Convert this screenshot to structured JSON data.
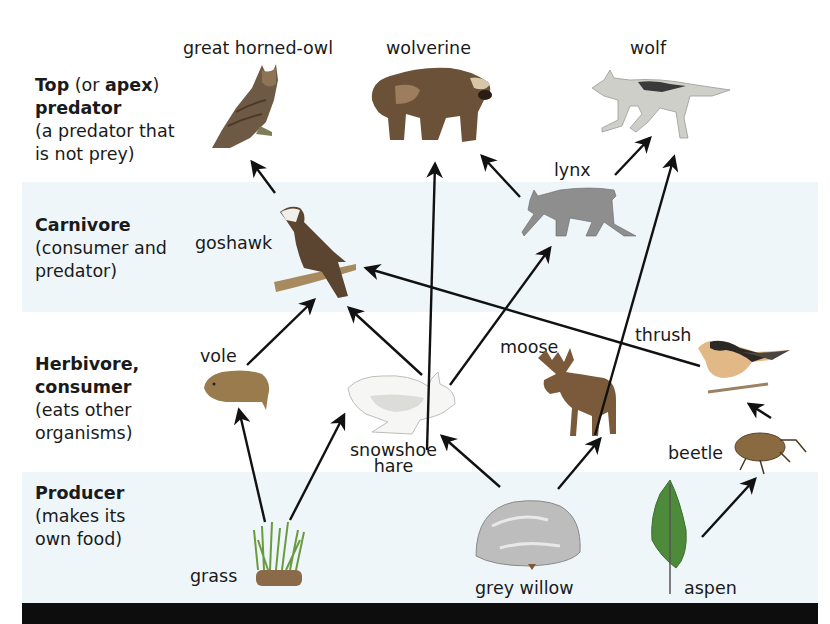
{
  "levels": [
    {
      "id": "top",
      "bold1": "Top",
      "normal1": " (or ",
      "bold2": "apex",
      "normal2": ")",
      "bold3": "predator",
      "desc1": "(a predator that",
      "desc2": "is not prey)"
    },
    {
      "id": "carnivore",
      "bold1": "Carnivore",
      "desc1": "(consumer and",
      "desc2": "predator)"
    },
    {
      "id": "herbivore",
      "bold1": "Herbivore,",
      "bold2": "consumer",
      "desc1": "(eats other",
      "desc2": "organisms)"
    },
    {
      "id": "producer",
      "bold1": "Producer",
      "desc1": "(makes its",
      "desc2": "own food)"
    }
  ],
  "organisms": {
    "owl": "great horned-owl",
    "wolverine": "wolverine",
    "wolf": "wolf",
    "lynx": "lynx",
    "goshawk": "goshawk",
    "vole": "vole",
    "hare_line1": "snowshoe",
    "hare_line2": "hare",
    "moose": "moose",
    "thrush": "thrush",
    "beetle": "beetle",
    "grass": "grass",
    "willow": "grey willow",
    "aspen": "aspen"
  },
  "edges": [
    {
      "from": "goshawk",
      "to": "great horned-owl"
    },
    {
      "from": "snowshoe hare",
      "to": "wolverine"
    },
    {
      "from": "lynx",
      "to": "wolverine"
    },
    {
      "from": "lynx",
      "to": "wolf"
    },
    {
      "from": "moose",
      "to": "wolf"
    },
    {
      "from": "snowshoe hare",
      "to": "lynx"
    },
    {
      "from": "thrush",
      "to": "goshawk"
    },
    {
      "from": "vole",
      "to": "goshawk"
    },
    {
      "from": "snowshoe hare",
      "to": "goshawk"
    },
    {
      "from": "grass",
      "to": "vole"
    },
    {
      "from": "grass",
      "to": "snowshoe hare"
    },
    {
      "from": "grey willow",
      "to": "snowshoe hare"
    },
    {
      "from": "grey willow",
      "to": "moose"
    },
    {
      "from": "beetle",
      "to": "thrush"
    },
    {
      "from": "aspen",
      "to": "beetle"
    }
  ],
  "colors": {
    "band": "#eef6fa",
    "footer": "#0d0d0d",
    "arrow": "#111111"
  }
}
